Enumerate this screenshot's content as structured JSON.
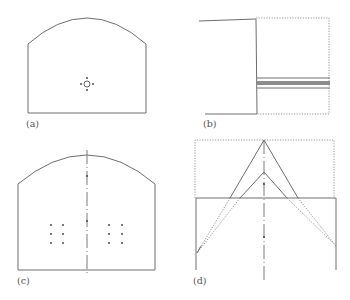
{
  "figure": {
    "panels": [
      {
        "id": "a",
        "label": "(a)",
        "description": "Arched cross-section with single central source and four surrounding points"
      },
      {
        "id": "b",
        "label": "(b)",
        "description": "Side section with dotted extension and horizontal band layers"
      },
      {
        "id": "c",
        "label": "(c)",
        "description": "Arched cross-section with centerline and symmetric dot arrays"
      },
      {
        "id": "d",
        "label": "(d)",
        "description": "Rectangular section with nested triangular (V) lines from apex"
      }
    ],
    "colors": {
      "line": "#6e6e6e",
      "dotted": "#8a8a8a",
      "band": "#8c8c8c",
      "dot": "#3a3a3a",
      "label": "#555555"
    }
  }
}
